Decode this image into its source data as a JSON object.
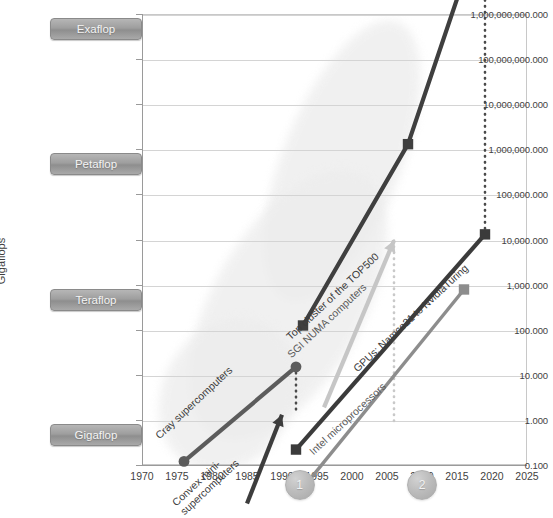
{
  "chart_data": {
    "type": "line",
    "title": "",
    "xlabel": "",
    "ylabel": "Gigaflops",
    "yscale": "log",
    "ylim": [
      0.1,
      1000000000000
    ],
    "xlim": [
      1970,
      2025
    ],
    "grid": true,
    "legend_position": "inline-labels",
    "y_tick_labels": [
      "1,000,000,000.000",
      "100,000,000.000",
      "10,000,000.000",
      "1,000,000.000",
      "100,000.000",
      "10,000.000",
      "1,000.000",
      "100.000",
      "10.000",
      "1.000",
      "0.100"
    ],
    "y_tick_values": [
      1000000000000,
      100000000000,
      10000000000,
      1000000000,
      100000000,
      10000000,
      1000000,
      100000,
      10000,
      1000,
      100
    ],
    "x_tick_labels": [
      "1970",
      "1975",
      "1980",
      "1985",
      "1990",
      "1995",
      "2000",
      "2005",
      "2010",
      "2015",
      "2020",
      "2025"
    ],
    "scale_badges": [
      {
        "label": "Exaflop",
        "value": 1000000000000
      },
      {
        "label": "Petaflop",
        "value": 1000000000
      },
      {
        "label": "Teraflop",
        "value": 1000000
      },
      {
        "label": "Gigaflop",
        "value": 1000
      }
    ],
    "series": [
      {
        "name": "Top cluster of the TOP500",
        "color": "#3f3f3f",
        "marker": "square",
        "weight": "thick",
        "label_text": "Top cluster of the TOP500",
        "points": [
          {
            "x": 1993,
            "y": 124
          },
          {
            "x": 2008,
            "y": 1300000
          },
          {
            "x": 2019,
            "y": 148000000000
          }
        ]
      },
      {
        "name": "GPUs: Namco21 to NvidiaTuring",
        "color": "#3b3b3b",
        "marker": "square",
        "weight": "thick",
        "label_text": "GPUs: Namco21 to NvidiaTuring",
        "points": [
          {
            "x": 1992,
            "y": 0.22
          },
          {
            "x": 2019,
            "y": 13000
          }
        ]
      },
      {
        "name": "Intel microprocessors",
        "color": "#8d8d8d",
        "marker": "square",
        "weight": "medium",
        "label_text": "Intel microprocessors",
        "points": [
          {
            "x": 1993,
            "y": 0.031
          },
          {
            "x": 2016,
            "y": 780
          }
        ]
      },
      {
        "name": "SGI NUMA computers",
        "color": "#c6c6c6",
        "marker": "arrow",
        "weight": "thick",
        "label_text": "SGI NUMA computers",
        "points": [
          {
            "x": 1996,
            "y": 1.9
          },
          {
            "x": 2006,
            "y": 9500
          }
        ]
      },
      {
        "name": "Cray supercomputers",
        "color": "#5c5c5c",
        "marker": "circle",
        "weight": "thick",
        "label_text": "Cray supercomputers",
        "points": [
          {
            "x": 1976,
            "y": 0.12
          },
          {
            "x": 1992,
            "y": 15
          }
        ]
      },
      {
        "name": "Convex mini-supercomputers",
        "color": "#3d3d3d",
        "marker": "arrow",
        "weight": "thick",
        "label_text": "Convex mini-\nsupercomputers",
        "points": [
          {
            "x": 1985,
            "y": 0.014
          },
          {
            "x": 1990,
            "y": 1.3
          }
        ]
      }
    ],
    "connectors": [
      {
        "name": "top500-to-gpu",
        "x": 2019,
        "y_from": 148000000000,
        "y_to": 13000,
        "style": "dotted"
      },
      {
        "name": "cray-to-convex",
        "x": 1992,
        "y_from": 15,
        "y_to": 1.3,
        "style": "dotted"
      },
      {
        "name": "sgi-to-gpu",
        "x": 2006,
        "y_from": 9500,
        "y_to": 0.8,
        "style": "dotted"
      }
    ],
    "annotations": [
      {
        "label": "1",
        "x": 1992.5
      },
      {
        "label": "2",
        "x": 2010
      }
    ]
  }
}
